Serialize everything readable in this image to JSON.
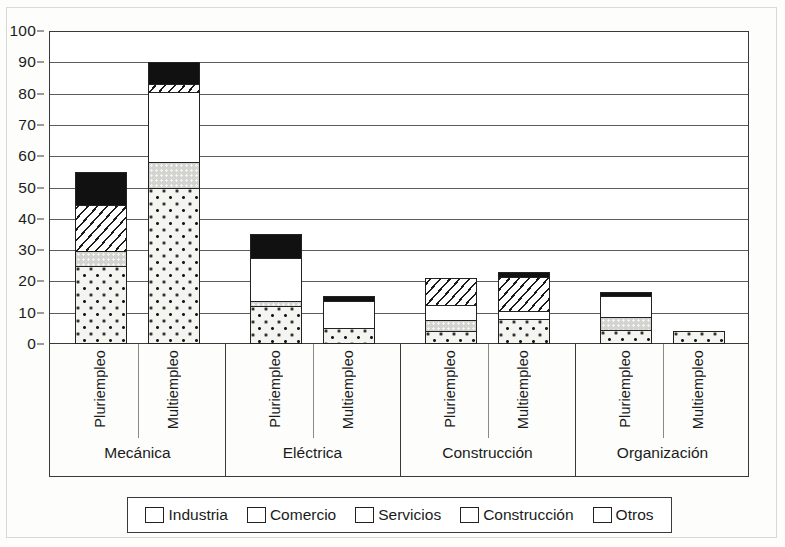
{
  "chart_data": {
    "type": "bar",
    "subtype": "stacked-bar-grouped",
    "title": "",
    "xlabel": "",
    "ylabel": "",
    "ylim": [
      0,
      100
    ],
    "y_ticks": [
      0,
      10,
      20,
      30,
      40,
      50,
      60,
      70,
      80,
      90,
      100
    ],
    "grid": "horizontal",
    "legend_position": "bottom",
    "groups": [
      "Mecánica",
      "Eléctrica",
      "Construcción",
      "Organización"
    ],
    "categories": [
      "Pluriempleo",
      "Multiempleo",
      "Pluriempleo",
      "Multiempleo",
      "Pluriempleo",
      "Multiempleo",
      "Pluriempleo",
      "Multiempleo"
    ],
    "series": [
      {
        "name": "Industria",
        "pattern": "dotted",
        "values": [
          25,
          50,
          12,
          5,
          4,
          8,
          4.5,
          4
        ]
      },
      {
        "name": "Comercio",
        "pattern": "gray",
        "values": [
          5,
          8.5,
          2,
          0,
          4,
          0,
          4.5,
          0
        ]
      },
      {
        "name": "Servicios",
        "pattern": "white",
        "values": [
          0,
          22.5,
          14,
          9,
          5,
          3,
          7,
          0
        ]
      },
      {
        "name": "Construcción",
        "pattern": "diagonal",
        "values": [
          15,
          3,
          0,
          0,
          9,
          11,
          0,
          0
        ]
      },
      {
        "name": "Otros",
        "pattern": "black",
        "values": [
          11,
          7.5,
          8,
          2,
          0,
          2,
          1.5,
          0
        ]
      }
    ],
    "totals": [
      56,
      91.5,
      36,
      16,
      22,
      24,
      17.5,
      4
    ]
  },
  "legend": {
    "items": [
      {
        "label": "Industria",
        "pattern": "dotted"
      },
      {
        "label": "Comercio",
        "pattern": "gray"
      },
      {
        "label": "Servicios",
        "pattern": "white"
      },
      {
        "label": "Construcción",
        "pattern": "diagonal"
      },
      {
        "label": "Otros",
        "pattern": "black"
      }
    ]
  },
  "colors": {
    "axis": "#3a3a3a",
    "grid": "#5d5d5d",
    "text": "#1b1b1b",
    "industria_fill": "#f4f4f0",
    "comercio_fill": "#d3d3cf",
    "servicios_fill": "#ffffff",
    "otros_fill": "#111111"
  }
}
